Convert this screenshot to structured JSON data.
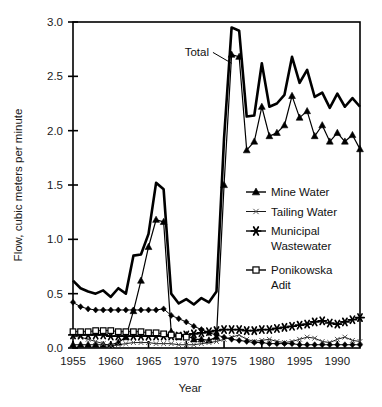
{
  "chart_data": {
    "type": "line",
    "title": "",
    "xlabel": "Year",
    "ylabel": "Flow, cubic meters per minute",
    "xlim": [
      1955,
      1993
    ],
    "ylim": [
      0.0,
      3.0
    ],
    "grid": false,
    "legend_position": "inside-right",
    "xticks": [
      1955,
      1960,
      1965,
      1970,
      1975,
      1980,
      1985,
      1990
    ],
    "xticklabels": [
      "1955",
      "1960",
      "1965",
      "1970",
      "1975",
      "1980",
      "1995",
      "1990"
    ],
    "yticks": [
      0.0,
      0.5,
      1.0,
      1.5,
      2.0,
      2.5,
      3.0
    ],
    "yticklabels": [
      "0.0",
      "0.5",
      "1.0",
      "1.5",
      "2.0",
      "2.5",
      "3.0"
    ],
    "annotations": [
      {
        "text": "Total",
        "x": 1973.0,
        "y": 2.72,
        "points_to_x": 1976.0,
        "points_to_y": 2.62
      }
    ],
    "x": [
      1955,
      1956,
      1957,
      1958,
      1959,
      1960,
      1961,
      1962,
      1963,
      1964,
      1965,
      1966,
      1967,
      1968,
      1969,
      1970,
      1971,
      1972,
      1973,
      1974,
      1975,
      1976,
      1977,
      1978,
      1979,
      1980,
      1981,
      1982,
      1983,
      1984,
      1985,
      1986,
      1987,
      1988,
      1989,
      1990,
      1991,
      1992,
      1993
    ],
    "series": [
      {
        "name": "Total",
        "marker": "none",
        "linewidth": 2.6,
        "values": [
          0.62,
          0.55,
          0.52,
          0.5,
          0.53,
          0.47,
          0.55,
          0.5,
          0.85,
          0.86,
          1.05,
          1.52,
          1.46,
          0.5,
          0.41,
          0.45,
          0.4,
          0.46,
          0.42,
          0.52,
          1.93,
          2.95,
          2.92,
          2.13,
          2.14,
          2.62,
          2.22,
          2.25,
          2.33,
          2.68,
          2.44,
          2.56,
          2.31,
          2.35,
          2.21,
          2.34,
          2.22,
          2.3,
          2.22
        ]
      },
      {
        "name": "Mine Water",
        "marker": "triangle-filled",
        "linewidth": 1.2,
        "values": [
          0.03,
          0.03,
          0.03,
          0.03,
          0.03,
          0.03,
          0.05,
          0.1,
          0.34,
          0.62,
          0.93,
          1.18,
          1.16,
          0.15,
          0.1,
          0.12,
          0.08,
          0.08,
          0.07,
          0.1,
          1.5,
          2.7,
          2.68,
          1.82,
          1.9,
          2.22,
          1.95,
          1.98,
          2.05,
          2.32,
          2.12,
          2.18,
          1.95,
          2.05,
          1.9,
          1.98,
          1.9,
          1.96,
          1.83
        ]
      },
      {
        "name": "Tailing Water",
        "marker": "x-small",
        "linewidth": 0.9,
        "values": [
          0.11,
          0.1,
          0.08,
          0.06,
          0.04,
          0.02,
          0.03,
          0.04,
          0.05,
          0.05,
          0.05,
          0.04,
          0.04,
          0.04,
          0.03,
          0.03,
          0.03,
          0.04,
          0.05,
          0.06,
          0.08,
          0.1,
          0.12,
          0.08,
          0.06,
          0.07,
          0.08,
          0.06,
          0.05,
          0.06,
          0.08,
          0.1,
          0.09,
          0.06,
          0.05,
          0.08,
          0.1,
          0.07,
          0.06
        ]
      },
      {
        "name": "Municipal Wastewater",
        "marker": "asterisk",
        "linewidth": 1.0,
        "values": [
          0.12,
          0.12,
          0.12,
          0.12,
          0.12,
          0.11,
          0.11,
          0.11,
          0.11,
          0.11,
          0.11,
          0.11,
          0.11,
          0.11,
          0.11,
          0.12,
          0.13,
          0.14,
          0.15,
          0.16,
          0.17,
          0.17,
          0.17,
          0.16,
          0.16,
          0.17,
          0.17,
          0.18,
          0.19,
          0.2,
          0.21,
          0.22,
          0.24,
          0.25,
          0.23,
          0.22,
          0.24,
          0.26,
          0.28
        ]
      },
      {
        "name": "Ponikowska Adit",
        "marker": "square-open",
        "linewidth": 1.0,
        "values": [
          0.15,
          0.15,
          0.15,
          0.16,
          0.16,
          0.16,
          0.15,
          0.15,
          0.15,
          0.15,
          0.14,
          0.14,
          0.13,
          0.12,
          0.11,
          0.1,
          null,
          null,
          null,
          null,
          null,
          null,
          null,
          null,
          null,
          null,
          null,
          null,
          null,
          null,
          null,
          null,
          null,
          null,
          null,
          null,
          null,
          null,
          null
        ]
      },
      {
        "name": "Mine Water Secondary",
        "marker": "diamond-filled",
        "linewidth": 1.0,
        "values": [
          0.42,
          0.38,
          0.36,
          0.35,
          0.35,
          0.35,
          0.35,
          0.35,
          0.35,
          0.35,
          0.35,
          0.35,
          0.36,
          0.3,
          0.27,
          0.24,
          0.2,
          0.17,
          0.14,
          0.12,
          0.1,
          0.08,
          0.07,
          0.06,
          0.05,
          0.05,
          0.04,
          0.04,
          0.04,
          0.04,
          0.03,
          0.03,
          0.03,
          0.03,
          0.03,
          0.03,
          0.03,
          0.03,
          0.03
        ]
      }
    ],
    "legend": [
      {
        "label": "Mine Water",
        "marker": "triangle-filled"
      },
      {
        "label": "Tailing Water",
        "marker": "x-small"
      },
      {
        "label": "Municipal Wastewater",
        "marker": "asterisk"
      },
      {
        "label": "Ponikowska Adit",
        "marker": "square-open"
      }
    ]
  }
}
